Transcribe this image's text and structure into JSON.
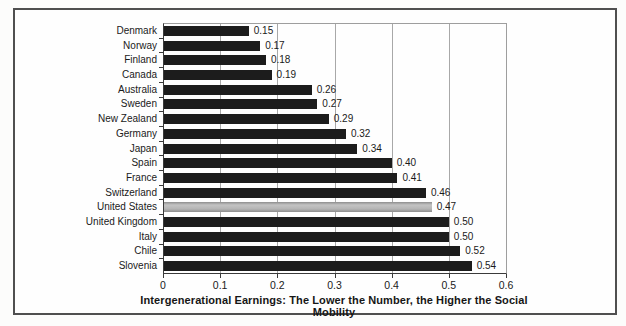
{
  "figure": {
    "caption": "Intergenerational Earnings: The Lower the Number, the Higher the Social Mobility"
  },
  "chart_data": {
    "type": "bar",
    "orientation": "horizontal",
    "title": "Intergenerational Earnings: The Lower the Number, the Higher the Social Mobility",
    "xlabel": "",
    "ylabel": "",
    "categories": [
      "Denmark",
      "Norway",
      "Finland",
      "Canada",
      "Australia",
      "Sweden",
      "New Zealand",
      "Germany",
      "Japan",
      "Spain",
      "France",
      "Switzerland",
      "United States",
      "United Kingdom",
      "Italy",
      "Chile",
      "Slovenia"
    ],
    "values": [
      0.15,
      0.17,
      0.18,
      0.19,
      0.26,
      0.27,
      0.29,
      0.32,
      0.34,
      0.4,
      0.41,
      0.46,
      0.47,
      0.5,
      0.5,
      0.52,
      0.54
    ],
    "value_label_decimals": 2,
    "highlight_category": "United States",
    "xlim": [
      0,
      0.6
    ],
    "xticks": [
      0,
      0.1,
      0.2,
      0.3,
      0.4,
      0.5,
      0.6
    ],
    "xtick_labels": [
      "0",
      "0.1",
      "0.2",
      "0.3",
      "0.4",
      "0.5",
      "0.6"
    ],
    "grid": true,
    "legend": "none",
    "colors": {
      "bar": "#1c1c1c",
      "highlight_bar": "#a9a9a9",
      "gridline": "#a8a8a8",
      "axis": "#3a3a3a",
      "frame_border": "#4f4f4f",
      "text": "#1a1a1a"
    }
  }
}
